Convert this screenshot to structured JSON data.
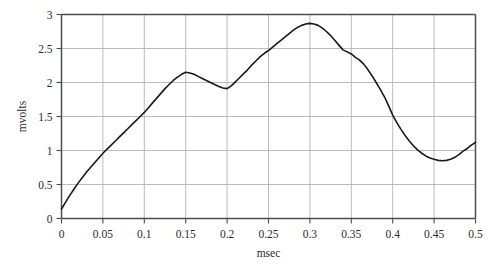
{
  "chart_data": {
    "type": "line",
    "title": "",
    "subtitle": "",
    "xlabel": "msec",
    "ylabel": "mvolts",
    "xlim": [
      0,
      0.5
    ],
    "ylim": [
      0,
      3
    ],
    "grid": true,
    "legend": null,
    "legend_position": "none",
    "x_ticks": [
      0,
      0.05,
      0.1,
      0.15,
      0.2,
      0.25,
      0.3,
      0.35,
      0.4,
      0.45,
      0.5
    ],
    "x_tick_labels": [
      "0",
      "0.05",
      "0.1",
      "0.15",
      "0.2",
      "0.25",
      "0.3",
      "0.35",
      "0.4",
      "0.45",
      "0.5"
    ],
    "y_ticks": [
      0,
      0.5,
      1,
      1.5,
      2,
      2.5,
      3
    ],
    "y_tick_labels": [
      "0",
      "0.5",
      "1",
      "1.5",
      "2",
      "2.5",
      "3"
    ],
    "line_color": "#1a1a1a",
    "line_width": 1.6,
    "grid_color": "#b4b4b4",
    "axis_color": "#4d4d4d",
    "series": [
      {
        "name": "signal",
        "x": [
          0.0,
          0.005,
          0.01,
          0.015,
          0.02,
          0.025,
          0.03,
          0.035,
          0.04,
          0.045,
          0.05,
          0.055,
          0.06,
          0.065,
          0.07,
          0.075,
          0.08,
          0.085,
          0.09,
          0.095,
          0.1,
          0.105,
          0.11,
          0.115,
          0.12,
          0.125,
          0.13,
          0.135,
          0.14,
          0.145,
          0.15,
          0.155,
          0.16,
          0.165,
          0.17,
          0.175,
          0.18,
          0.185,
          0.19,
          0.195,
          0.2,
          0.205,
          0.21,
          0.215,
          0.22,
          0.225,
          0.23,
          0.235,
          0.24,
          0.245,
          0.25,
          0.255,
          0.26,
          0.265,
          0.27,
          0.275,
          0.28,
          0.285,
          0.29,
          0.295,
          0.3,
          0.305,
          0.31,
          0.315,
          0.32,
          0.325,
          0.33,
          0.335,
          0.34,
          0.345,
          0.35,
          0.355,
          0.36,
          0.365,
          0.37,
          0.375,
          0.38,
          0.385,
          0.39,
          0.395,
          0.4,
          0.405,
          0.41,
          0.415,
          0.42,
          0.425,
          0.43,
          0.435,
          0.44,
          0.445,
          0.45,
          0.455,
          0.46,
          0.465,
          0.47,
          0.475,
          0.48,
          0.485,
          0.49,
          0.495,
          0.5
        ],
        "values": [
          0.14,
          0.24,
          0.34,
          0.43,
          0.52,
          0.6,
          0.68,
          0.75,
          0.82,
          0.89,
          0.96,
          1.02,
          1.08,
          1.14,
          1.2,
          1.26,
          1.32,
          1.38,
          1.44,
          1.5,
          1.56,
          1.63,
          1.7,
          1.77,
          1.84,
          1.91,
          1.97,
          2.03,
          2.08,
          2.12,
          2.15,
          2.14,
          2.12,
          2.09,
          2.06,
          2.03,
          2.0,
          1.97,
          1.94,
          1.92,
          1.91,
          1.95,
          2.01,
          2.07,
          2.13,
          2.19,
          2.26,
          2.32,
          2.38,
          2.43,
          2.47,
          2.52,
          2.57,
          2.62,
          2.67,
          2.72,
          2.77,
          2.81,
          2.84,
          2.86,
          2.87,
          2.86,
          2.84,
          2.8,
          2.75,
          2.69,
          2.62,
          2.55,
          2.48,
          2.45,
          2.42,
          2.37,
          2.33,
          2.27,
          2.19,
          2.1,
          2.0,
          1.9,
          1.79,
          1.66,
          1.52,
          1.41,
          1.31,
          1.22,
          1.14,
          1.07,
          1.01,
          0.96,
          0.92,
          0.89,
          0.87,
          0.855,
          0.85,
          0.855,
          0.87,
          0.9,
          0.94,
          0.99,
          1.03,
          1.08,
          1.12
        ],
        "annotations": [
          {
            "label": "start",
            "x": 0.0,
            "y": 0.14
          },
          {
            "label": "first local maximum",
            "x": 0.15,
            "y": 2.15
          },
          {
            "label": "local minimum",
            "x": 0.2,
            "y": 1.91
          },
          {
            "label": "global maximum",
            "x": 0.3,
            "y": 2.87
          },
          {
            "label": "shoulder",
            "x": 0.345,
            "y": 2.45
          },
          {
            "label": "final minimum",
            "x": 0.46,
            "y": 0.85
          },
          {
            "label": "end",
            "x": 0.5,
            "y": 1.12
          }
        ]
      }
    ]
  }
}
